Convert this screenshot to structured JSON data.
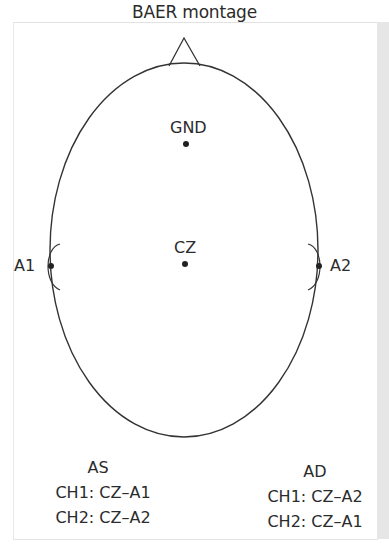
{
  "title": "BAER montage",
  "colors": {
    "line": "#333333",
    "text": "#2b2b2b",
    "frame": "#e2e2e2",
    "strip": "#e6e6e6"
  },
  "electrodes": [
    {
      "id": "gnd",
      "label": "GND"
    },
    {
      "id": "cz",
      "label": "CZ"
    },
    {
      "id": "a1",
      "label": "A1"
    },
    {
      "id": "a2",
      "label": "A2"
    }
  ],
  "legends": {
    "left": {
      "heading": "AS",
      "rows": [
        "CH1: CZ–A1",
        "CH2: CZ–A2"
      ]
    },
    "right": {
      "heading": "AD",
      "rows": [
        "CH1: CZ–A2",
        "CH2: CZ–A1"
      ]
    }
  }
}
